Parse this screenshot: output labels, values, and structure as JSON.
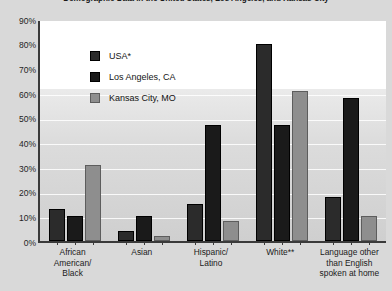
{
  "chart_data": {
    "type": "bar",
    "title": "Demographic Data in the United States, Los Angeles, and Kansas City",
    "xlabel": "",
    "ylabel": "",
    "ylim": [
      0,
      90
    ],
    "ytick_labels": [
      "90%",
      "80%",
      "70%",
      "60%",
      "50%",
      "40%",
      "30%",
      "20%",
      "10%",
      "0%"
    ],
    "ytick_values": [
      90,
      80,
      70,
      60,
      50,
      40,
      30,
      20,
      10,
      0
    ],
    "grid": true,
    "legend_position": "top-left",
    "categories": [
      "African American/ Black",
      "Asian",
      "Hispanic/ Latino",
      "White**",
      "Language other than English spoken at home"
    ],
    "category_lines": [
      [
        "African",
        "American/",
        "Black"
      ],
      [
        "Asian"
      ],
      [
        "Hispanic/",
        "Latino"
      ],
      [
        "White**"
      ],
      [
        "Language other",
        "than English",
        "spoken at home"
      ]
    ],
    "series": [
      {
        "name": "USA*",
        "color": "#2b2b2b",
        "values": [
          13,
          4,
          15,
          80,
          18
        ]
      },
      {
        "name": "Los Angeles, CA",
        "color": "#1a1a1a",
        "values": [
          10,
          10,
          47,
          47,
          58
        ]
      },
      {
        "name": "Kansas City, MO",
        "color": "#8e8e8e",
        "values": [
          31,
          2,
          8,
          61,
          10
        ]
      }
    ]
  }
}
